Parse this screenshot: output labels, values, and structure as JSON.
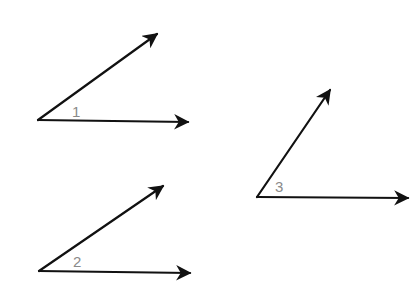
{
  "diagram": {
    "type": "angles",
    "colors": {
      "ray": "#111111",
      "label": "#8a8a8a",
      "background": "#ffffff"
    },
    "angles": [
      {
        "label": "1",
        "vertex": [
          38,
          120
        ],
        "ray_a_tip": [
          157,
          34
        ],
        "ray_b_tip": [
          188,
          122
        ],
        "label_pos": [
          72,
          117
        ]
      },
      {
        "label": "2",
        "vertex": [
          39,
          271
        ],
        "ray_a_tip": [
          163,
          186
        ],
        "ray_b_tip": [
          190,
          273
        ],
        "label_pos": [
          73,
          267
        ]
      },
      {
        "label": "3",
        "vertex": [
          257,
          197
        ],
        "ray_a_tip": [
          330,
          90
        ],
        "ray_b_tip": [
          408,
          198
        ],
        "label_pos": [
          275,
          192
        ]
      }
    ]
  }
}
